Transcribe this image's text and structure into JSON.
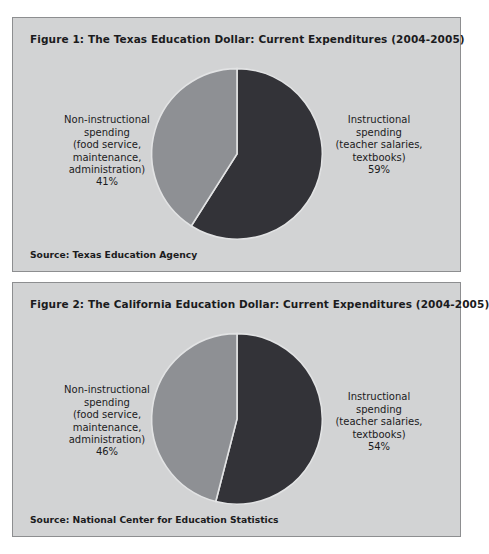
{
  "document": {
    "background_color": "#ffffff",
    "panel_background": "#d2d3d4",
    "panel_border": "#8d8e90"
  },
  "figures": [
    {
      "title": "Figure 1: The Texas Education Dollar: Current Expenditures (2004-2005)",
      "source": "Source: Texas Education Agency",
      "left_label": "Non-instructional\nspending\n(food service,\nmaintenance,\nadministration)",
      "left_pct": "41%",
      "right_label": "Instructional\nspending\n(teacher salaries,\ntextbooks)",
      "right_pct": "59%"
    },
    {
      "title": "Figure 2: The California Education Dollar: Current Expenditures (2004-2005)",
      "source": "Source: National Center for Education Statistics",
      "left_label": "Non-instructional\nspending\n(food service,\nmaintenance,\nadministration)",
      "left_pct": "46%",
      "right_label": "Instructional\nspending\n(teacher salaries,\ntextbooks)",
      "right_pct": "54%"
    }
  ],
  "chart_data": [
    {
      "type": "pie",
      "title": "Figure 1: The Texas Education Dollar: Current Expenditures (2004-2005)",
      "source": "Source: Texas Education Agency",
      "categories": [
        "Instructional spending (teacher salaries, textbooks)",
        "Non-instructional spending (food service, maintenance, administration)"
      ],
      "values": [
        59,
        41
      ],
      "unit": "percent",
      "colors": [
        "#333338",
        "#8e9094"
      ],
      "start_angle_deg": 0,
      "direction": "clockwise",
      "legend": "labels-outside",
      "grid": false
    },
    {
      "type": "pie",
      "title": "Figure 2: The California Education Dollar: Current Expenditures (2004-2005)",
      "source": "Source: National Center for Education Statistics",
      "categories": [
        "Instructional spending (teacher salaries, textbooks)",
        "Non-instructional spending (food service, maintenance, administration)"
      ],
      "values": [
        54,
        46
      ],
      "unit": "percent",
      "colors": [
        "#333338",
        "#8e9094"
      ],
      "start_angle_deg": 0,
      "direction": "clockwise",
      "legend": "labels-outside",
      "grid": false
    }
  ]
}
